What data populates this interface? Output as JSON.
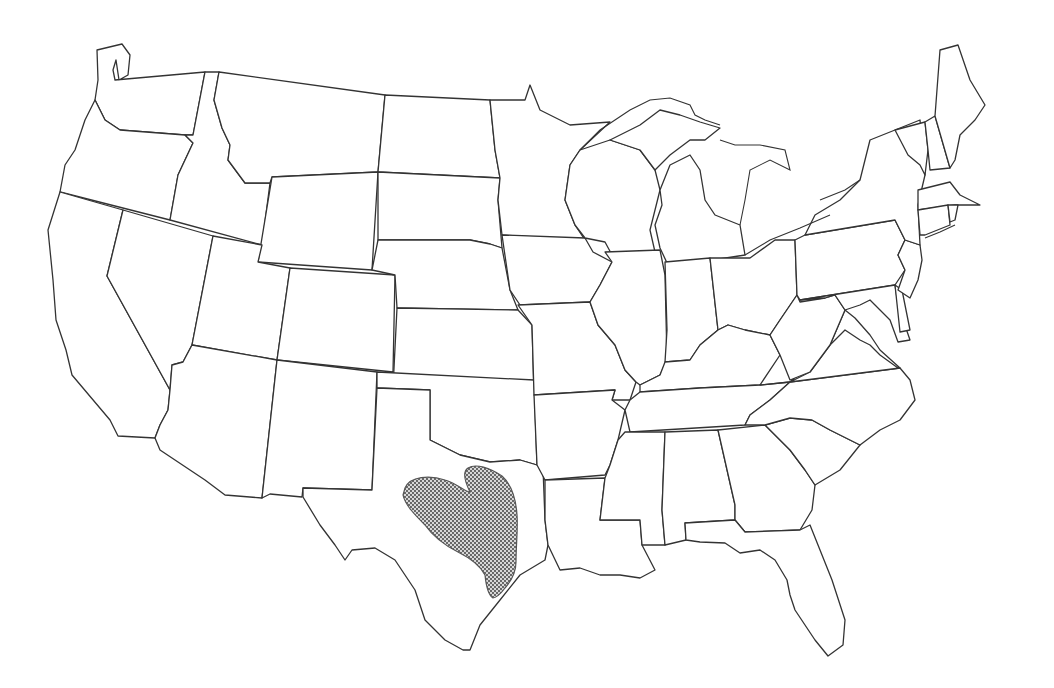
{
  "map": {
    "type": "outline map",
    "region": "Contiguous United States",
    "boundaries": "state lines",
    "labels_visible": false,
    "highlighted_regions": [
      {
        "id": "central-texas-range",
        "state": "Texas",
        "description": "Stippled range area in east-central Texas extending to the Gulf coast",
        "pattern": "dot stipple",
        "fill_color": "#888888"
      }
    ],
    "colors": {
      "background": "#ffffff",
      "boundary": "#333333",
      "stipple": "#555555"
    },
    "states": [
      "WA",
      "OR",
      "CA",
      "ID",
      "NV",
      "MT",
      "WY",
      "UT",
      "AZ",
      "CO",
      "NM",
      "ND",
      "SD",
      "NE",
      "KS",
      "OK",
      "TX",
      "MN",
      "IA",
      "MO",
      "AR",
      "LA",
      "WI",
      "IL",
      "MI",
      "IN",
      "OH",
      "KY",
      "TN",
      "MS",
      "AL",
      "GA",
      "FL",
      "SC",
      "NC",
      "VA",
      "WV",
      "PA",
      "NY",
      "MD",
      "DE",
      "NJ",
      "CT",
      "RI",
      "MA",
      "VT",
      "NH",
      "ME"
    ]
  }
}
